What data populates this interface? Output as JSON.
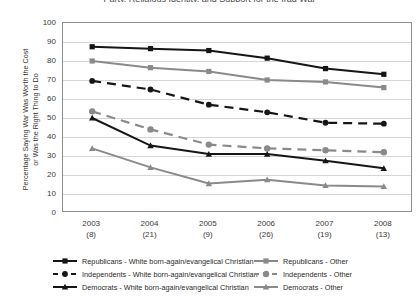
{
  "title": "Party, Religious Identity, and Support for the Iraq War",
  "axes": {
    "ylabel_line1": "Percentage Saying War Was Worth the Cost",
    "ylabel_line2": "or Was the Right Thing to Do",
    "yticks": [
      100,
      90,
      80,
      70,
      60,
      50,
      40,
      30,
      20,
      10,
      0
    ],
    "xticks": [
      {
        "year": "2003",
        "n": "(8)"
      },
      {
        "year": "2004",
        "n": "(21)"
      },
      {
        "year": "2005",
        "n": "(9)"
      },
      {
        "year": "2006",
        "n": "(26)"
      },
      {
        "year": "2007",
        "n": "(19)"
      },
      {
        "year": "2008",
        "n": "(13)"
      }
    ]
  },
  "legend": {
    "items": [
      {
        "label": "Republicans - White born-again/evangelical Christian",
        "key": "solid-square-black",
        "col": "left",
        "row": 0
      },
      {
        "label": "Republicans - Other",
        "key": "solid-square-gray",
        "col": "right",
        "row": 0
      },
      {
        "label": "Independents - White born-again/evangelical Christian",
        "key": "dashed-circle-black",
        "col": "left",
        "row": 1
      },
      {
        "label": "Independents - Other",
        "key": "dashed-circle-open-gray",
        "col": "right",
        "row": 1
      },
      {
        "label": "Democrats - White born-again/evangelical Christian",
        "key": "solid-triangle-black",
        "col": "left",
        "row": 2
      },
      {
        "label": "Democrats - Other",
        "key": "solid-triangle-gray",
        "col": "right",
        "row": 2
      }
    ]
  },
  "colors": {
    "born_again": "#161616",
    "other": "#8a8a8a",
    "grid": "#d6d6d6",
    "axis": "#8e8e8e"
  },
  "chart_data": {
    "type": "line",
    "title": "Party, Religious Identity, and Support for the Iraq War",
    "xlabel": "",
    "ylabel": "Percentage Saying War Was Worth the Cost or Was the Right Thing to Do",
    "ylim": [
      0,
      100
    ],
    "ytick_step": 10,
    "grid": true,
    "legend_position": "bottom",
    "categories": [
      "2003",
      "2004",
      "2005",
      "2006",
      "2007",
      "2008"
    ],
    "category_counts": [
      "(8)",
      "(21)",
      "(9)",
      "(26)",
      "(19)",
      "(13)"
    ],
    "series": [
      {
        "name": "Republicans - White born-again/evangelical Christian",
        "values": [
          87.5,
          86.5,
          85.5,
          81.5,
          76.0,
          73.0
        ],
        "color": "#161616",
        "marker": "square",
        "line": "solid"
      },
      {
        "name": "Republicans - Other",
        "values": [
          80.0,
          76.5,
          74.5,
          70.0,
          69.0,
          66.0
        ],
        "color": "#8a8a8a",
        "marker": "square",
        "line": "solid"
      },
      {
        "name": "Independents - White born-again/evangelical Christian",
        "values": [
          69.5,
          65.0,
          57.0,
          53.0,
          47.5,
          47.0
        ],
        "color": "#161616",
        "marker": "circle",
        "line": "dashed"
      },
      {
        "name": "Independents - Other",
        "values": [
          53.5,
          44.0,
          36.0,
          34.0,
          33.0,
          32.0
        ],
        "color": "#8a8a8a",
        "marker": "circle-open",
        "line": "dashed"
      },
      {
        "name": "Democrats - White born-again/evangelical Christian",
        "values": [
          50.0,
          35.5,
          31.0,
          31.0,
          27.5,
          23.5
        ],
        "color": "#161616",
        "marker": "triangle",
        "line": "solid"
      },
      {
        "name": "Democrats - Other",
        "values": [
          34.0,
          24.0,
          15.5,
          17.5,
          14.5,
          14.0
        ],
        "color": "#8a8a8a",
        "marker": "triangle",
        "line": "solid"
      }
    ]
  }
}
